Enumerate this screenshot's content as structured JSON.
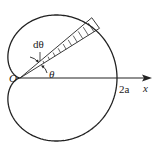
{
  "diagram": {
    "type": "cardioid-polar-area",
    "curve": "r = a(1 + cos θ)",
    "labels": {
      "origin": "O",
      "angle_element": "dθ",
      "angle": "θ",
      "intercept": "2a",
      "x_axis": "x"
    },
    "colors": {
      "stroke": "#222222",
      "background": "#ffffff"
    }
  }
}
